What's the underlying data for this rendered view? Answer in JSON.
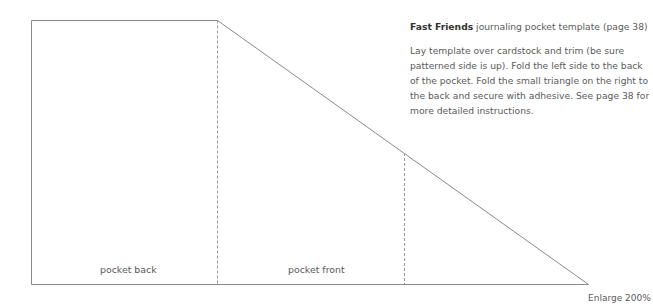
{
  "caption": {
    "title_bold": "Fast Friends",
    "title_rest": " journaling pocket template (page 38)",
    "instructions": "Lay template over cardstock and trim (be sure patterned side is up). Fold the left side to the back of the pocket. Fold the small triangle on the right to the back and secure with adhesive. See page 38 for more detailed instructions."
  },
  "template": {
    "panels": [
      {
        "label": "pocket back"
      },
      {
        "label": "pocket front"
      }
    ],
    "line_color": "#8a8a8a",
    "fold_line_color": "#9a9a9a"
  },
  "footer": {
    "enlarge_note": "Enlarge 200%"
  }
}
